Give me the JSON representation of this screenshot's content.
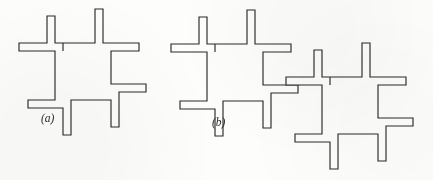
{
  "figure": {
    "kind": "line-drawing",
    "background_color": "#fdfdfb",
    "ink_color": "#2b2b2b",
    "stroke_width": 1.15,
    "width": 433,
    "height": 180,
    "panels": [
      {
        "id": "a",
        "label": "(a)",
        "label_x": 41,
        "label_y": 122,
        "unit_count": 1,
        "units": [
          {
            "name": "pinwheel-unit-a1",
            "center_square": {
              "x": 63,
              "y": 51,
              "width": 48,
              "height": 49
            },
            "arm_width": 8,
            "outline": "M 63 51 L 63 43 L 55 43 L 55 16 L 47 16 L 47 43 L 19 43 L 19 51 L 55 51 L 55 100 L 28 100 L 28 108 L 63 108 L 63 135 L 71 135 L 71 100 L 111 100 L 111 127 L 119 127 L 119 92 L 146 92 L 146 84 L 111 84 L 111 51 L 139 51 L 139 43 L 103 43 L 103 9 L 95 9 L 95 43 L 63 43 Z"
          }
        ]
      },
      {
        "id": "b",
        "label": "(b)",
        "label_x": 212,
        "label_y": 126,
        "unit_count": 2,
        "units": [
          {
            "name": "pinwheel-unit-b1",
            "center_square": {
              "x": 215,
              "y": 52,
              "width": 48,
              "height": 49
            },
            "arm_width": 8,
            "outline": "M 215 52 L 215 44 L 207 44 L 207 17 L 199 17 L 199 44 L 171 44 L 171 52 L 207 52 L 207 101 L 180 101 L 180 109 L 215 109 L 215 136 L 223 136 L 223 101 L 263 101 L 263 128 L 271 128 L 271 93 L 298 93 L 298 85 L 263 85 L 263 52 L 291 52 L 291 44 L 255 44 L 255 10 L 247 10 L 247 44 L 215 44 Z"
          },
          {
            "name": "pinwheel-unit-b2",
            "center_square": {
              "x": 330,
              "y": 85,
              "width": 48,
              "height": 49
            },
            "arm_width": 8,
            "outline": "M 330 85 L 330 77 L 322 77 L 322 50 L 314 50 L 314 77 L 286 77 L 286 85 L 322 85 L 322 134 L 295 134 L 295 142 L 330 142 L 330 169 L 338 169 L 338 134 L 378 134 L 378 161 L 386 161 L 386 126 L 413 126 L 413 118 L 378 118 L 378 85 L 406 85 L 406 77 L 370 77 L 370 43 L 362 43 L 362 77 L 330 77 Z"
          }
        ]
      }
    ]
  }
}
